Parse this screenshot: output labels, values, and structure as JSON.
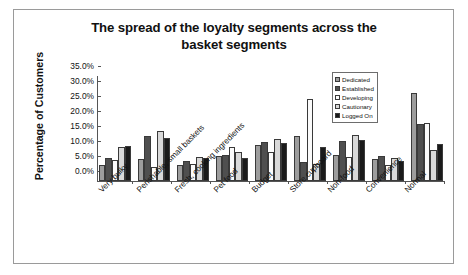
{
  "chart_data": {
    "type": "bar",
    "title": "The spread of the loyalty segments across the basket segments",
    "title_line1": "The spread of the loyalty segments across the",
    "title_line2": "basket segments",
    "xlabel": "",
    "ylabel": "Percentage of Customers",
    "ylim": [
      0,
      35
    ],
    "ytick_labels": [
      "0.0%",
      "5.0%",
      "10.0%",
      "15.0%",
      "20.0%",
      "25.0%",
      "30.0%",
      "35.0%"
    ],
    "ytick_values": [
      0,
      5,
      10,
      15,
      20,
      25,
      30,
      35
    ],
    "grid": false,
    "legend_position": "top-right",
    "categories": [
      "Very bulky",
      "Perishable, small baskets",
      "Fresh, cooking ingredients",
      "Pet food",
      "Budget",
      "Store cupboard",
      "Non-food",
      "Convenience",
      "Normal"
    ],
    "series": [
      {
        "name": "Dedicated",
        "color": "#9d9d9d",
        "values": [
          5.5,
          7.3,
          5.2,
          8.3,
          11.9,
          14.9,
          8.6,
          7.3,
          29.4
        ]
      },
      {
        "name": "Established",
        "color": "#4f4f4f",
        "values": [
          7.7,
          15.1,
          6.6,
          8.6,
          13.1,
          6.3,
          13.3,
          8.4,
          19.0
        ]
      },
      {
        "name": "Developing",
        "color": "#fbfbfb",
        "values": [
          6.9,
          4.8,
          5.7,
          11.2,
          9.6,
          27.2,
          7.9,
          5.2,
          19.4
        ]
      },
      {
        "name": "Cautionary",
        "color": "#d9d9d9",
        "values": [
          11.2,
          16.6,
          8.0,
          9.8,
          14.0,
          5.6,
          15.4,
          7.6,
          10.5
        ]
      },
      {
        "name": "Logged On",
        "color": "#1a1a1a",
        "values": [
          11.7,
          14.3,
          7.8,
          7.7,
          12.7,
          11.4,
          13.7,
          6.6,
          12.4
        ]
      }
    ]
  }
}
